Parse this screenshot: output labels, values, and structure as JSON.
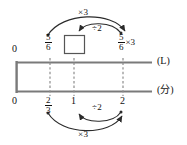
{
  "diagram": {
    "type": "double-number-line",
    "title_visible": false,
    "colors": {
      "line": "#7a7a7a",
      "dashed": "#8d8d8d",
      "arc": "#2b2b2b",
      "text": "#111111",
      "box_border": "#555555",
      "background": "#ffffff"
    },
    "axes": [
      {
        "id": "upper",
        "unit_label": "(L)",
        "ticks": [
          {
            "label_type": "integer",
            "value": "0",
            "x": 16
          },
          {
            "label_type": "fraction",
            "num": "5",
            "den": "6",
            "x": 50
          },
          {
            "label_type": "box",
            "value": "",
            "x": 74
          },
          {
            "label_type": "fraction",
            "num": "5",
            "den": "6",
            "suffix": "×3",
            "x": 123
          }
        ]
      },
      {
        "id": "lower",
        "unit_label": "(分)",
        "ticks": [
          {
            "label_type": "integer",
            "value": "0",
            "x": 16
          },
          {
            "label_type": "fraction",
            "num": "2",
            "den": "3",
            "x": 50
          },
          {
            "label_type": "integer",
            "value": "1",
            "x": 74
          },
          {
            "label_type": "integer",
            "value": "2",
            "x": 123
          }
        ]
      }
    ],
    "operations": [
      {
        "id": "upper-times3",
        "label": "×3",
        "from": "5/6",
        "to": "5/6×3",
        "side": "above",
        "direction": "right"
      },
      {
        "id": "upper-div2",
        "label": "÷2",
        "from": "5/6×3",
        "to": "box",
        "side": "above",
        "direction": "left"
      },
      {
        "id": "lower-div2",
        "label": "÷2",
        "from": "2",
        "to": "1",
        "side": "below",
        "direction": "left"
      },
      {
        "id": "lower-times3",
        "label": "×3",
        "from": "2/3",
        "to": "2",
        "side": "below",
        "direction": "right"
      }
    ]
  }
}
